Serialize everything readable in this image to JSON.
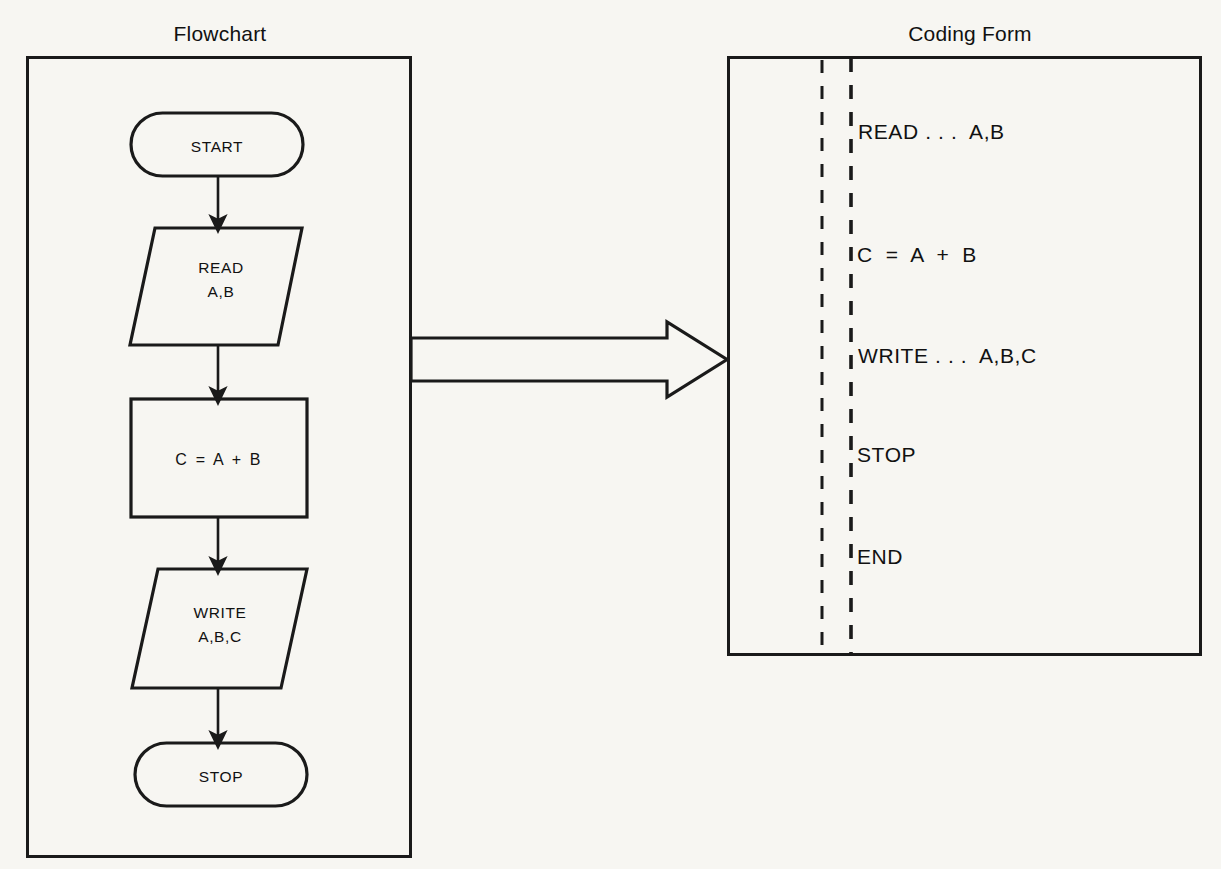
{
  "page": {
    "background_color": "#f7f6f2",
    "ink_color": "#1a1a1a"
  },
  "flowchart": {
    "title": "Flowchart",
    "nodes": [
      {
        "id": "start",
        "shape": "terminator",
        "label": "START"
      },
      {
        "id": "read",
        "shape": "parallelogram",
        "label": "READ\nA,B"
      },
      {
        "id": "assign",
        "shape": "rectangle",
        "label": "C  =  A  +  B"
      },
      {
        "id": "write",
        "shape": "parallelogram",
        "label": "WRITE\nA,B,C"
      },
      {
        "id": "stop",
        "shape": "terminator",
        "label": "STOP"
      }
    ]
  },
  "transform_arrow": {
    "name": "block-arrow-right",
    "direction": "right",
    "from": "flowchart",
    "to": "coding-form"
  },
  "coding_form": {
    "title": "Coding Form",
    "margin_rules": [
      "dashed-margin-1",
      "dashed-margin-2"
    ],
    "lines": [
      "READ . . .  A,B",
      "C  =  A  +  B",
      "WRITE . . .  A,B,C",
      "STOP",
      "END"
    ]
  }
}
